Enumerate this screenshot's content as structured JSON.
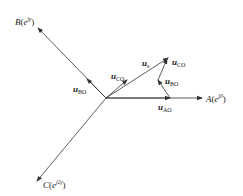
{
  "diagram": {
    "type": "phasor-vector-diagram",
    "axes": [
      {
        "id": "A",
        "label": "A",
        "phasor": "e",
        "exponent": "j0"
      },
      {
        "id": "B",
        "label": "B",
        "phasor": "e",
        "exponent": "jγ"
      },
      {
        "id": "C",
        "label": "C",
        "phasor": "e",
        "exponent": "j2γ"
      }
    ],
    "vectors": [
      {
        "id": "u_s",
        "symbol": "u",
        "subscript": "s"
      },
      {
        "id": "u_AO",
        "symbol": "u",
        "subscript": "AO"
      },
      {
        "id": "u_BO_axis",
        "symbol": "u",
        "subscript": "BO"
      },
      {
        "id": "u_CO_axis",
        "symbol": "u",
        "subscript": "CO"
      },
      {
        "id": "u_BO_sum",
        "symbol": "u",
        "subscript": "BO"
      },
      {
        "id": "u_CO_sum",
        "symbol": "u",
        "subscript": "CO"
      }
    ],
    "colors": {
      "line": "#333333",
      "text": "#222222",
      "background": "#ffffff"
    }
  }
}
